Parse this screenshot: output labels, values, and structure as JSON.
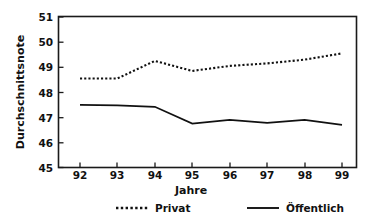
{
  "chart_data": {
    "type": "line",
    "title": "",
    "subtitle": "",
    "xlabel": "Jahre",
    "ylabel": "Durchschnittsnote",
    "categories": [
      "92",
      "93",
      "94",
      "95",
      "96",
      "97",
      "98",
      "99"
    ],
    "x": [
      92,
      93,
      94,
      95,
      96,
      97,
      98,
      99
    ],
    "xlim": [
      91.5,
      99.7
    ],
    "ylim": [
      45,
      51
    ],
    "yticks": [
      45,
      46,
      47,
      48,
      49,
      50,
      51
    ],
    "ytick_labels": [
      "45",
      "46",
      "47",
      "48",
      "49",
      "50",
      "51"
    ],
    "xticks": [
      92,
      93,
      94,
      95,
      96,
      97,
      98,
      99
    ],
    "xtick_labels": [
      "92",
      "93",
      "94",
      "95",
      "96",
      "97",
      "98",
      "99"
    ],
    "grid": false,
    "legend_position": "bottom",
    "series": [
      {
        "name": "Privat",
        "style": "dotted",
        "color": "#111111",
        "values": [
          48.55,
          48.55,
          49.25,
          48.85,
          49.05,
          49.15,
          49.3,
          49.55
        ]
      },
      {
        "name": "Öffentlich",
        "style": "solid",
        "color": "#111111",
        "values": [
          47.5,
          47.48,
          47.42,
          46.75,
          46.9,
          46.78,
          46.9,
          46.7
        ]
      }
    ],
    "annotations": []
  },
  "axes": {
    "y_title": "Durchschnittsnote",
    "x_title": "Jahre",
    "y_ticks": [
      "51",
      "50",
      "49",
      "48",
      "47",
      "46",
      "45"
    ],
    "x_ticks": [
      "92",
      "93",
      "94",
      "95",
      "96",
      "97",
      "98",
      "99"
    ]
  },
  "legend": {
    "items": [
      {
        "label": "Privat",
        "marker": "dotted-line-icon"
      },
      {
        "label": "Öffentlich",
        "marker": "solid-line-icon"
      }
    ]
  }
}
